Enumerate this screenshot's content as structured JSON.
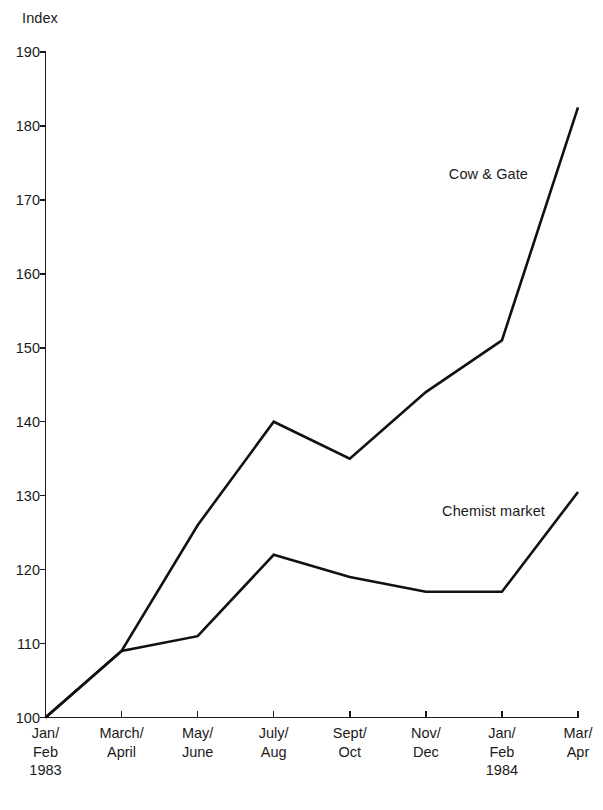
{
  "chart_data": {
    "type": "line",
    "title": "",
    "subtitle": "",
    "xlabel": "",
    "ylabel": "Index",
    "ylim": [
      100,
      190
    ],
    "y_ticks": [
      100,
      110,
      120,
      130,
      140,
      150,
      160,
      170,
      180,
      190
    ],
    "grid": false,
    "legend_position": "inline-annotation",
    "categories": [
      "Jan/ Feb 1983",
      "March/ April",
      "May/ June",
      "July/ Aug",
      "Sept/ Oct",
      "Nov/ Dec",
      "Jan/ Feb 1984",
      "Mar/ Apr"
    ],
    "series": [
      {
        "name": "Cow & Gate",
        "color": "#111111",
        "values": [
          100,
          109,
          126,
          140,
          135,
          144,
          151,
          182.5
        ]
      },
      {
        "name": "Chemist market",
        "color": "#111111",
        "values": [
          100,
          109,
          111,
          122,
          119,
          117,
          117,
          130.5
        ]
      }
    ]
  },
  "axes": {
    "y_unit_caption": "Index",
    "y_tick_labels": [
      "190",
      "180",
      "170",
      "160",
      "150",
      "140",
      "130",
      "120",
      "110",
      "100"
    ],
    "x_tick_labels": [
      {
        "line1": "Jan/",
        "line2": "Feb",
        "line3": "1983"
      },
      {
        "line1": "March/",
        "line2": "April",
        "line3": ""
      },
      {
        "line1": "May/",
        "line2": "June",
        "line3": ""
      },
      {
        "line1": "July/",
        "line2": "Aug",
        "line3": ""
      },
      {
        "line1": "Sept/",
        "line2": "Oct",
        "line3": ""
      },
      {
        "line1": "Nov/",
        "line2": "Dec",
        "line3": ""
      },
      {
        "line1": "Jan/",
        "line2": "Feb",
        "line3": "1984"
      },
      {
        "line1": "Mar/",
        "line2": "Apr",
        "line3": ""
      }
    ]
  },
  "annotations": [
    {
      "text": "Cow & Gate",
      "series": "Cow & Gate"
    },
    {
      "text": "Chemist market",
      "series": "Chemist market"
    }
  ]
}
